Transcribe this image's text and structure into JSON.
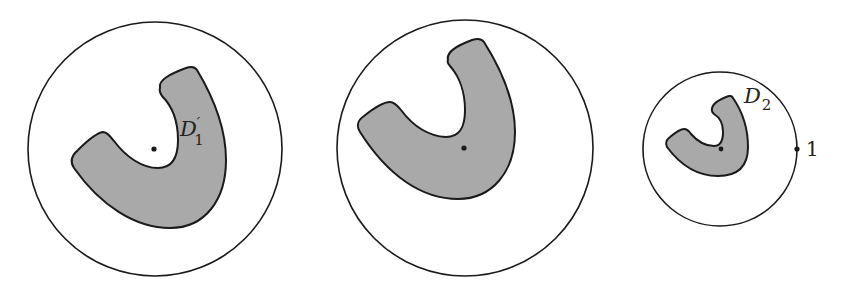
{
  "figure": {
    "panels": [
      {
        "id": "left",
        "circle": {
          "cx": 155,
          "cy": 149,
          "r": 127
        },
        "region_label": "D",
        "region_label_prime": "′",
        "region_label_sub": "1",
        "center_dot": {
          "cx": 154,
          "cy": 149
        }
      },
      {
        "id": "middle",
        "circle": {
          "cx": 465,
          "cy": 148,
          "r": 128
        },
        "center_dot": {
          "cx": 464,
          "cy": 148
        }
      },
      {
        "id": "right",
        "circle": {
          "cx": 720,
          "cy": 149,
          "r": 77
        },
        "region_label": "D",
        "region_label_sub": "2",
        "center_dot": {
          "cx": 721,
          "cy": 149
        },
        "boundary_point_label": "1"
      }
    ],
    "colors": {
      "region_fill": "#a9a9a9",
      "stroke": "#1a1a1a",
      "background": "#ffffff"
    }
  }
}
